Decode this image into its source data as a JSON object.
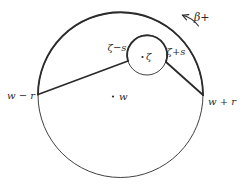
{
  "figure": {
    "type": "contour-diagram",
    "labels": {
      "outer_left": "w − r",
      "outer_right": "w + r",
      "outer_center": "w",
      "inner_left": "ζ−s",
      "inner_right": "ζ+s",
      "inner_center": "ζ",
      "orientation": "β+"
    },
    "colors": {
      "ink": "#2b2b2b",
      "background": "#ffffff"
    }
  }
}
